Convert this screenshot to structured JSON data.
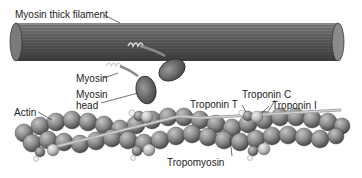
{
  "diagram": {
    "labels": {
      "thick_filament": "Myosin thick filament",
      "myosin": "Myosin",
      "myosin_head_1": "Myosin",
      "myosin_head_2": "head",
      "actin": "Actin",
      "troponin_t": "Troponin T",
      "troponin_c": "Troponin C",
      "troponin_i": "Troponin I",
      "tropomyosin": "Tropomyosin"
    },
    "colors": {
      "filament": "#6a6a6a",
      "filament_dark": "#3a3a3a",
      "actin_bead": "#8a8a8a",
      "troponin_light": "#c8c8c8",
      "label_text": "#222222"
    }
  }
}
